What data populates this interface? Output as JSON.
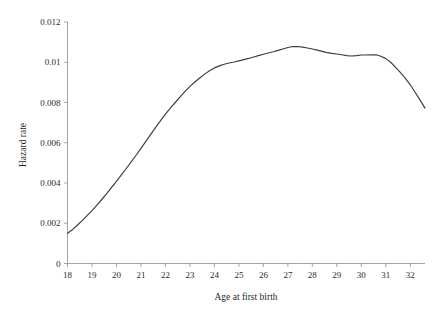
{
  "chart_data": {
    "type": "line",
    "title": "",
    "xlabel": "Age at first birth",
    "ylabel": "Hazard rate",
    "xlim": [
      18,
      32.6
    ],
    "ylim": [
      0,
      0.012
    ],
    "grid": false,
    "legend": null,
    "x_ticks": [
      "18",
      "19",
      "20",
      "21",
      "22",
      "23",
      "24",
      "25",
      "26",
      "27",
      "28",
      "29",
      "30",
      "31",
      "32"
    ],
    "x_tick_values": [
      18,
      19,
      20,
      21,
      22,
      23,
      24,
      25,
      26,
      27,
      28,
      29,
      30,
      31,
      32
    ],
    "y_ticks": [
      "0",
      "0.002",
      "0.004",
      "0.006",
      "0.008",
      "0.01",
      "0.012"
    ],
    "y_tick_values": [
      0,
      0.002,
      0.004,
      0.006,
      0.008,
      0.01,
      0.012
    ],
    "series": [
      {
        "name": "Hazard rate",
        "color": "#3c3c3c",
        "x": [
          18.0,
          18.2,
          18.4,
          18.6,
          18.8,
          19.0,
          19.2,
          19.4,
          19.6,
          19.8,
          20.0,
          20.2,
          20.4,
          20.6,
          20.8,
          21.0,
          21.2,
          21.4,
          21.6,
          21.8,
          22.0,
          22.2,
          22.4,
          22.6,
          22.8,
          23.0,
          23.2,
          23.4,
          23.6,
          23.8,
          24.0,
          24.2,
          24.4,
          24.6,
          24.8,
          25.0,
          25.2,
          25.4,
          25.6,
          25.8,
          26.0,
          26.2,
          26.4,
          26.6,
          26.8,
          27.0,
          27.2,
          27.4,
          27.6,
          27.8,
          28.0,
          28.2,
          28.4,
          28.6,
          28.8,
          29.0,
          29.2,
          29.4,
          29.6,
          29.8,
          30.0,
          30.2,
          30.4,
          30.6,
          30.8,
          31.0,
          31.2,
          31.4,
          31.6,
          31.8,
          32.0,
          32.2,
          32.4,
          32.6
        ],
        "values": [
          0.0015,
          0.00168,
          0.0019,
          0.00213,
          0.00238,
          0.00263,
          0.0029,
          0.00318,
          0.00347,
          0.00378,
          0.00408,
          0.0044,
          0.00472,
          0.00505,
          0.00538,
          0.00572,
          0.00607,
          0.00642,
          0.00676,
          0.0071,
          0.00742,
          0.00772,
          0.008,
          0.00828,
          0.00855,
          0.0088,
          0.00902,
          0.00922,
          0.00941,
          0.00958,
          0.00972,
          0.00982,
          0.0099,
          0.00996,
          0.01001,
          0.01007,
          0.01013,
          0.01019,
          0.01026,
          0.01033,
          0.0104,
          0.01046,
          0.01052,
          0.01059,
          0.01066,
          0.01073,
          0.01078,
          0.01078,
          0.01075,
          0.01071,
          0.01066,
          0.0106,
          0.01054,
          0.01048,
          0.01044,
          0.01041,
          0.01037,
          0.01033,
          0.01031,
          0.01033,
          0.01036,
          0.01036,
          0.01037,
          0.01037,
          0.0103,
          0.01018,
          0.01,
          0.00975,
          0.00948,
          0.0092,
          0.00888,
          0.0085,
          0.00812,
          0.00772
        ]
      }
    ]
  },
  "axes": {
    "x_title": "Age at first birth",
    "y_title": "Hazard rate"
  }
}
